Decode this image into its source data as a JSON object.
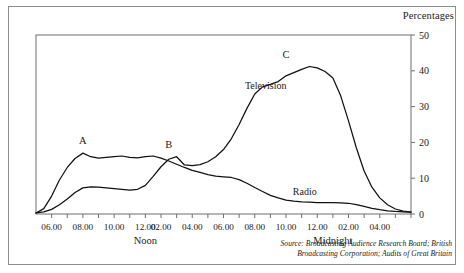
{
  "figure": {
    "units_label": "Percentages",
    "source_lines": [
      "Source: Broadcasting Audience Research Board; British",
      "Broadcasting Corporation; Audits of Great Britain"
    ]
  },
  "chart_data": {
    "type": "line",
    "title": "",
    "xlabel": "",
    "ylabel": "Percentages",
    "ylim": [
      0,
      50
    ],
    "yticks": [
      0,
      10,
      20,
      30,
      40,
      50
    ],
    "grid": false,
    "legend": "inline-labels",
    "x_axis": {
      "start_hour": 5,
      "end_hour": 29,
      "tick_interval_hours": 1,
      "label_interval_hours": 2,
      "tick_labels": [
        "06.00",
        "08.00",
        "10.00",
        "12.00",
        "02.00",
        "04.00",
        "06.00",
        "08.00",
        "10.00",
        "12.00",
        "02.00",
        "04.00"
      ],
      "tick_label_hours": [
        6,
        8,
        10,
        12,
        13,
        15,
        17,
        19,
        21,
        23,
        25,
        27
      ],
      "period_markers": [
        {
          "label": "Noon",
          "hour": 12
        },
        {
          "label": "Midnight",
          "hour": 24
        }
      ]
    },
    "annotations": [
      {
        "label": "A",
        "hour": 8,
        "value": 17,
        "series": "Radio"
      },
      {
        "label": "B",
        "hour": 13.5,
        "value": 16,
        "series": "Television"
      },
      {
        "label": "C",
        "hour": 21,
        "value": 41,
        "series": "Television"
      }
    ],
    "series": [
      {
        "name": "Radio",
        "label": "Radio",
        "label_hour": 22.2,
        "label_value": 5.2,
        "color": "#111111",
        "x": [
          5,
          5.5,
          6,
          6.5,
          7,
          7.5,
          8,
          8.5,
          9,
          9.5,
          10,
          10.5,
          11,
          11.5,
          12,
          12.5,
          13,
          13.5,
          14,
          14.5,
          15,
          15.5,
          16,
          16.5,
          17,
          17.5,
          18,
          18.5,
          19,
          19.5,
          20,
          20.5,
          21,
          21.5,
          22,
          22.5,
          23,
          23.5,
          24,
          24.5,
          25,
          25.5,
          26,
          26.5,
          27,
          27.5,
          28,
          28.5,
          29
        ],
        "values": [
          0.3,
          1.5,
          5.0,
          9.5,
          13.0,
          15.5,
          17.0,
          16.0,
          15.6,
          15.8,
          16.0,
          16.2,
          15.8,
          15.7,
          16.0,
          16.2,
          15.6,
          14.8,
          13.9,
          13.0,
          12.2,
          11.6,
          11.0,
          10.6,
          10.4,
          10.2,
          9.6,
          8.6,
          7.4,
          6.3,
          5.2,
          4.5,
          3.9,
          3.6,
          3.4,
          3.3,
          3.2,
          3.2,
          3.2,
          3.1,
          3.0,
          2.6,
          2.1,
          1.6,
          1.2,
          0.9,
          0.7,
          0.6,
          0.5
        ]
      },
      {
        "name": "Television",
        "label": "Television",
        "label_hour": 19.7,
        "label_value": 35,
        "color": "#111111",
        "x": [
          5,
          5.5,
          6,
          6.5,
          7,
          7.5,
          8,
          8.5,
          9,
          9.5,
          10,
          10.5,
          11,
          11.5,
          12,
          12.5,
          13,
          13.5,
          14,
          14.5,
          15,
          15.5,
          16,
          16.5,
          17,
          17.5,
          18,
          18.5,
          19,
          19.5,
          20,
          20.5,
          21,
          21.5,
          22,
          22.5,
          23,
          23.5,
          24,
          24.5,
          25,
          25.5,
          26,
          26.5,
          27,
          27.5,
          28,
          28.5,
          29
        ],
        "values": [
          0.3,
          0.6,
          1.3,
          2.6,
          4.2,
          6.0,
          7.3,
          7.6,
          7.5,
          7.3,
          7.1,
          6.9,
          6.7,
          6.9,
          8.0,
          10.5,
          13.2,
          15.3,
          16.0,
          13.7,
          13.5,
          13.8,
          14.6,
          16.0,
          18.0,
          21.0,
          25.0,
          29.5,
          33.5,
          35.5,
          36.2,
          37.0,
          38.6,
          39.5,
          40.4,
          41.2,
          40.8,
          39.8,
          38.0,
          33.0,
          26.0,
          18.5,
          12.0,
          7.5,
          4.5,
          2.6,
          1.4,
          0.8,
          0.5
        ]
      }
    ]
  }
}
